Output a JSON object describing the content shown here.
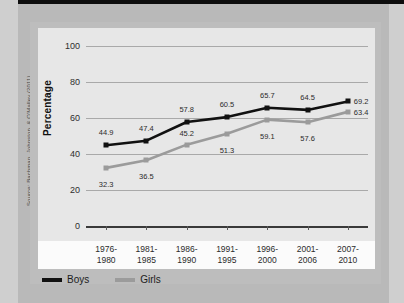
{
  "source_credit": "Source: Bachman, Johnston, & O'Malley (2011)",
  "legend": {
    "position": "bottom-left",
    "items": [
      {
        "label": "Boys",
        "color": "#111111"
      },
      {
        "label": "Girls",
        "color": "#9b9b9b"
      }
    ]
  },
  "chart_data": {
    "type": "line",
    "title": "",
    "subtitle": "",
    "xlabel": "",
    "ylabel": "Percentage",
    "ylim": [
      0,
      100
    ],
    "yticks": [
      0,
      20,
      40,
      60,
      80,
      100
    ],
    "grid": true,
    "legend_position": "bottom-left",
    "categories": [
      "1976-\n1980",
      "1981-\n1985",
      "1986-\n1990",
      "1991-\n1995",
      "1996-\n2000",
      "2001-\n2006",
      "2007-\n2010"
    ],
    "category_lines": [
      [
        "1976-",
        "1980"
      ],
      [
        "1981-",
        "1985"
      ],
      [
        "1986-",
        "1990"
      ],
      [
        "1991-",
        "1995"
      ],
      [
        "1996-",
        "2000"
      ],
      [
        "2001-",
        "2006"
      ],
      [
        "2007-",
        "2010"
      ]
    ],
    "series": [
      {
        "name": "Boys",
        "color": "#111111",
        "values": [
          44.9,
          47.4,
          57.8,
          60.5,
          65.7,
          64.5,
          69.2
        ],
        "labels": [
          "44.9",
          "47.4",
          "57.8",
          "60.5",
          "65.7",
          "64.5",
          "69.2"
        ]
      },
      {
        "name": "Girls",
        "color": "#9b9b9b",
        "values": [
          32.3,
          36.5,
          45.2,
          51.3,
          59.1,
          57.6,
          63.4
        ],
        "labels": [
          "32.3",
          "36.5",
          "45.2",
          "51.3",
          "59.1",
          "57.6",
          "63.4"
        ]
      }
    ]
  }
}
